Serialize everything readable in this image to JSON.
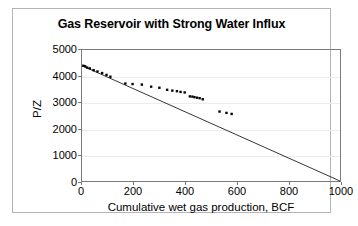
{
  "chart_data": {
    "type": "scatter",
    "title": "Gas Reservoir with Strong Water Influx",
    "xlabel": "Cumulative wet gas production, BCF",
    "ylabel": "P/Z",
    "xlim": [
      0,
      1000
    ],
    "ylim": [
      0,
      5000
    ],
    "xticks": [
      0,
      200,
      400,
      600,
      800,
      1000
    ],
    "yticks": [
      0,
      1000,
      2000,
      3000,
      4000,
      5000
    ],
    "grid": "horizontal",
    "legend": "none",
    "series": [
      {
        "name": "Observed P/Z data",
        "marker": "point",
        "color": "#000000",
        "points": [
          [
            5,
            4400
          ],
          [
            12,
            4380
          ],
          [
            20,
            4330
          ],
          [
            30,
            4300
          ],
          [
            45,
            4230
          ],
          [
            60,
            4180
          ],
          [
            78,
            4120
          ],
          [
            95,
            4050
          ],
          [
            110,
            3980
          ],
          [
            168,
            3720
          ],
          [
            196,
            3700
          ],
          [
            232,
            3680
          ],
          [
            268,
            3600
          ],
          [
            300,
            3560
          ],
          [
            330,
            3480
          ],
          [
            350,
            3450
          ],
          [
            368,
            3430
          ],
          [
            382,
            3400
          ],
          [
            398,
            3380
          ],
          [
            418,
            3230
          ],
          [
            428,
            3220
          ],
          [
            436,
            3200
          ],
          [
            446,
            3180
          ],
          [
            456,
            3160
          ],
          [
            468,
            3120
          ],
          [
            533,
            2650
          ],
          [
            560,
            2600
          ],
          [
            580,
            2560
          ]
        ]
      },
      {
        "name": "Volumetric depletion trend",
        "marker": "line",
        "color": "#000000",
        "points": [
          [
            0,
            4400
          ],
          [
            1000,
            0
          ]
        ]
      }
    ]
  }
}
